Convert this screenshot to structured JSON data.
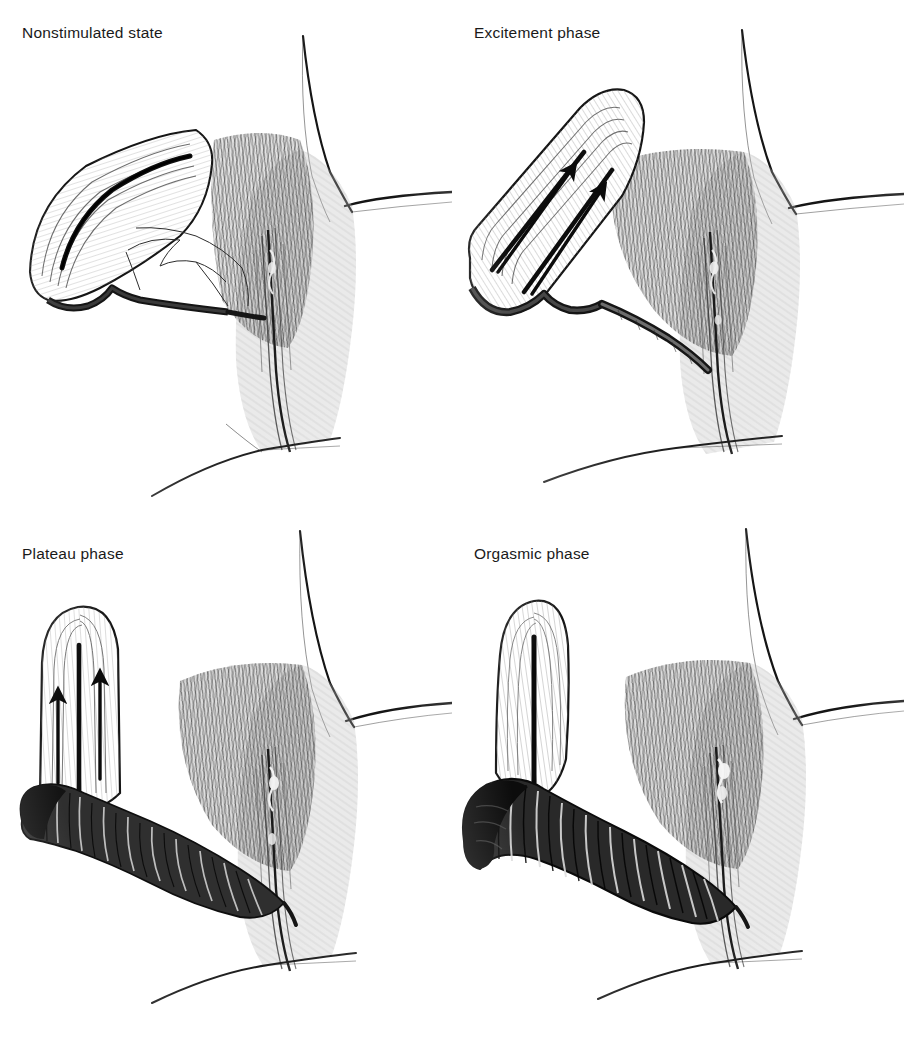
{
  "figure": {
    "medium": "pencil / graphite anatomical illustration",
    "background_color": "#ffffff",
    "ink_color": "#1a1a1a",
    "width": 904,
    "height": 1043,
    "layout": "2 x 2 grid of panels, label at top-left of each panel"
  },
  "panels": [
    {
      "id": "p0",
      "label": "Nonstimulated state",
      "position": "top-left",
      "arrows": 0,
      "arrow_direction": "none",
      "organ_orientation": "collapsed, lying horizontally, flattened lumen",
      "notes": "Unexpanded vaginal barrel shown collapsed with inner rugae outline; cervix and uterine outline visible; no motion arrows."
    },
    {
      "id": "p1",
      "label": "Excitement phase",
      "position": "top-right",
      "arrows": 2,
      "arrow_direction": "up-right (diagonal, outward expansion)",
      "organ_orientation": "tilted upward at roughly 45 degrees, beginning to balloon",
      "notes": "Vaginal barrel begins expanding and elevating; two diagonal arrows indicate transudation and ballooning of the inner two-thirds."
    },
    {
      "id": "p2",
      "label": "Plateau phase",
      "position": "bottom-left",
      "arrows": 2,
      "arrow_direction": "up (vertical, full expansion)",
      "organ_orientation": "fully elevated and vertical, maximum ballooning",
      "notes": "Inner two-thirds fully distended and tented; orgasmic platform forming in outer third, shown as a ribbed, darkly shaded band."
    },
    {
      "id": "p3",
      "label": "Orgasmic phase",
      "position": "bottom-right",
      "arrows": 0,
      "arrow_direction": "none",
      "organ_orientation": "vertical upper portion with strongly contracted, heavily corrugated lower third",
      "notes": "Orgasmic platform in rhythmic contraction — dense dark ribbing across the outer third; no arrows."
    }
  ],
  "colors": {
    "paper": "#ffffff",
    "outline": "#151515",
    "mid_tone": "#8a8a8a",
    "light_tone": "#cfcfcf",
    "dark_tone": "#2a2a2a"
  }
}
